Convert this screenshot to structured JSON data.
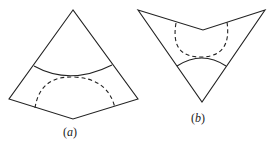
{
  "figure": {
    "panels": [
      {
        "id": "a",
        "label": "(a)",
        "label_text": "a",
        "description": "kite-shaped sector with solid arc across and dashed semicircle below"
      },
      {
        "id": "b",
        "label": "(b)",
        "label_text": "b",
        "description": "inverted arrowhead/concave kite with dashed semicircle above and solid arc below"
      }
    ],
    "colors": {
      "stroke": "#222222",
      "background": "#ffffff"
    }
  }
}
